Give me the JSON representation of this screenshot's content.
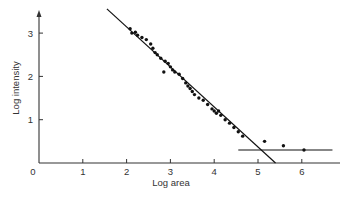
{
  "chart_data": {
    "type": "scatter",
    "title": "",
    "xlabel": "Log area",
    "ylabel": "Log intensity",
    "xlim": [
      0,
      6.8
    ],
    "ylim": [
      0,
      3.7
    ],
    "x_ticks": [
      0,
      1,
      2,
      3,
      4,
      5,
      6
    ],
    "y_ticks": [
      1,
      2,
      3
    ],
    "grid": false,
    "legend": null,
    "series": [
      {
        "name": "data",
        "points": [
          [
            2.08,
            3.1
          ],
          [
            2.12,
            3.0
          ],
          [
            2.2,
            3.02
          ],
          [
            2.25,
            2.95
          ],
          [
            2.35,
            2.9
          ],
          [
            2.45,
            2.85
          ],
          [
            2.55,
            2.75
          ],
          [
            2.6,
            2.65
          ],
          [
            2.65,
            2.55
          ],
          [
            2.7,
            2.5
          ],
          [
            2.78,
            2.42
          ],
          [
            2.85,
            2.1
          ],
          [
            2.88,
            2.35
          ],
          [
            2.95,
            2.3
          ],
          [
            3.0,
            2.22
          ],
          [
            3.05,
            2.15
          ],
          [
            3.1,
            2.1
          ],
          [
            3.2,
            2.05
          ],
          [
            3.28,
            1.95
          ],
          [
            3.35,
            1.85
          ],
          [
            3.4,
            1.78
          ],
          [
            3.45,
            1.72
          ],
          [
            3.5,
            1.65
          ],
          [
            3.55,
            1.58
          ],
          [
            3.65,
            1.5
          ],
          [
            3.75,
            1.45
          ],
          [
            3.85,
            1.35
          ],
          [
            3.95,
            1.25
          ],
          [
            4.0,
            1.2
          ],
          [
            4.05,
            1.15
          ],
          [
            4.1,
            1.2
          ],
          [
            4.15,
            1.1
          ],
          [
            4.25,
            1.0
          ],
          [
            4.35,
            0.92
          ],
          [
            4.45,
            0.82
          ],
          [
            4.55,
            0.72
          ],
          [
            4.65,
            0.62
          ],
          [
            5.15,
            0.5
          ],
          [
            5.58,
            0.4
          ],
          [
            6.05,
            0.3
          ]
        ]
      }
    ],
    "lines": [
      {
        "name": "fit",
        "from": [
          1.55,
          3.56
        ],
        "to": [
          5.4,
          0.0
        ]
      },
      {
        "name": "baseline",
        "from": [
          4.55,
          0.3
        ],
        "to": [
          6.7,
          0.3
        ]
      }
    ]
  }
}
